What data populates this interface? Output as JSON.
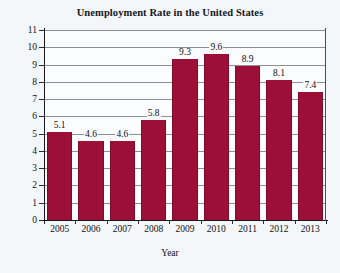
{
  "chart_data": {
    "type": "bar",
    "title": "Unemployment Rate in the United States",
    "xlabel": "Year",
    "ylabel": "Percent",
    "categories": [
      "2005",
      "2006",
      "2007",
      "2008",
      "2009",
      "2010",
      "2011",
      "2012",
      "2013"
    ],
    "values": [
      5.1,
      4.6,
      4.6,
      5.8,
      9.3,
      9.6,
      8.9,
      8.1,
      7.4
    ],
    "value_labels": [
      "5.1",
      "4.6",
      "4.6",
      "5.8",
      "9.3",
      "9.6",
      "8.9",
      "8.1",
      "7.4"
    ],
    "ylim": [
      0,
      11
    ],
    "ytick_labels": [
      "11",
      "10",
      "9",
      "8",
      "7",
      "6",
      "5",
      "4",
      "3",
      "2",
      "1",
      "0"
    ],
    "ytick_values": [
      11,
      10,
      9,
      8,
      7,
      6,
      5,
      4,
      3,
      2,
      1,
      0
    ],
    "grid": true,
    "legend": false,
    "bar_color": "#9c0f37",
    "grid_color": "#8b8f93",
    "axis_color": "#17171b",
    "background_color": "#f4f7f9",
    "plot_background_color": "#fbfcfd"
  }
}
